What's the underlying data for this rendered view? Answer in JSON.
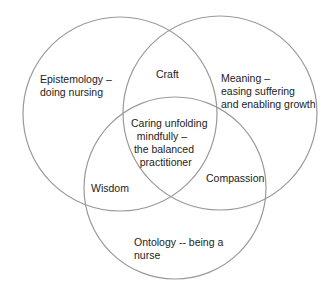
{
  "diagram": {
    "type": "venn",
    "stroke_color": "#9a9a9a",
    "background": "#ffffff",
    "circles": [
      {
        "name": "epistemology",
        "label": "Epistemology –\ndoing nursing"
      },
      {
        "name": "meaning",
        "label": "Meaning –\neasing suffering\nand enabling growth"
      },
      {
        "name": "ontology",
        "label": "Ontology -- being a\nnurse"
      }
    ],
    "intersections": {
      "epistemology_meaning": "Craft",
      "epistemology_ontology": "Wisdom",
      "meaning_ontology": "Compassion",
      "all_three": "Caring unfolding\n  mindfully –\n the balanced\n   practitioner"
    }
  }
}
